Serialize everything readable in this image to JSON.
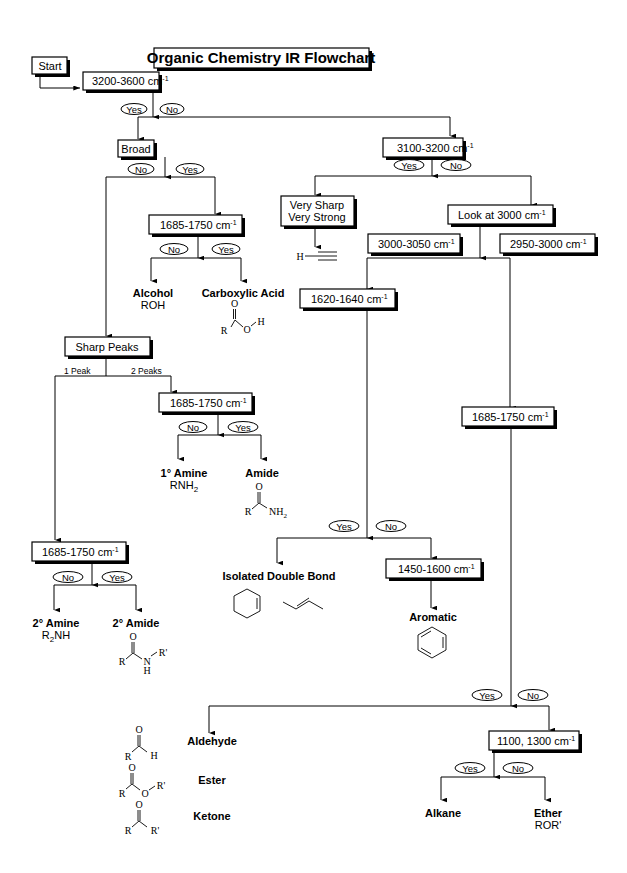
{
  "title": "Organic Chemistry IR Flowchart",
  "colors": {
    "ink": "#000000",
    "background": "#ffffff"
  },
  "nodes": {
    "start": "Start",
    "q1": {
      "text": "3200-3600 cm",
      "sup": "-1"
    },
    "broad": "Broad",
    "q_3100": {
      "text": "3100-3200 cm",
      "sup": "-1"
    },
    "q_1685_acid": {
      "text": "1685-1750 cm",
      "sup": "-1"
    },
    "very_sharp": [
      "Very Sharp",
      "Very Strong"
    ],
    "look_3000": {
      "text": "Look at 3000 cm",
      "sup": "-1"
    },
    "r_3000_3050": {
      "text": "3000-3050 cm",
      "sup": "-1"
    },
    "r_2950_3000": {
      "text": "2950-3000 cm",
      "sup": "-1"
    },
    "q_1620": {
      "text": "1620-1640 cm",
      "sup": "-1"
    },
    "sharp_peaks": "Sharp Peaks",
    "q_1685_amide": {
      "text": "1685-1750 cm",
      "sup": "-1"
    },
    "q_1685_carbonyl": {
      "text": "1685-1750 cm",
      "sup": "-1"
    },
    "q_1685_secondary": {
      "text": "1685-1750 cm",
      "sup": "-1"
    },
    "q_1450": {
      "text": "1450-1600 cm",
      "sup": "-1"
    },
    "q_1100": {
      "text": "1100, 1300 cm",
      "sup": "-1"
    }
  },
  "answers": {
    "yes": "Yes",
    "no": "No"
  },
  "edge_labels": {
    "one_peak": "1 Peak",
    "two_peaks": "2 Peaks"
  },
  "results": {
    "alcohol": {
      "name": "Alcohol",
      "formula": "ROH"
    },
    "carboxylic_acid": {
      "name": "Carboxylic Acid"
    },
    "primary_amine": {
      "name": "1° Amine",
      "formula_main": "RNH",
      "formula_sub": "2"
    },
    "amide": {
      "name": "Amide"
    },
    "secondary_amine": {
      "name": "2° Amine",
      "formula_pre": "R",
      "formula_sub": "2",
      "formula_post": "NH"
    },
    "secondary_amide": {
      "name": "2° Amide"
    },
    "isolated_double_bond": {
      "name": "Isolated Double Bond"
    },
    "aromatic": {
      "name": "Aromatic"
    },
    "aldehyde": {
      "name": "Aldehyde"
    },
    "ester": {
      "name": "Ester"
    },
    "ketone": {
      "name": "Ketone"
    },
    "alkane": {
      "name": "Alkane"
    },
    "ether": {
      "name": "Ether",
      "formula": "ROR'"
    }
  },
  "structure_labels": {
    "R": "R",
    "Rp": "R'",
    "H": "H",
    "O": "O",
    "N": "N",
    "NH": "NH",
    "sub2": "2"
  }
}
